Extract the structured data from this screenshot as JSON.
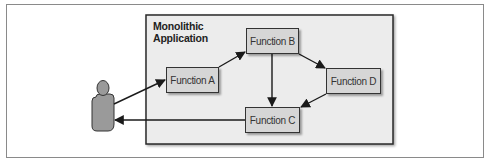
{
  "diagram": {
    "container": {
      "title_line1": "Monolithic",
      "title_line2": "Application"
    },
    "actor": {
      "type": "user",
      "icon": "person-icon"
    },
    "nodes": [
      {
        "id": "A",
        "label": "Function A"
      },
      {
        "id": "B",
        "label": "Function B"
      },
      {
        "id": "C",
        "label": "Function C"
      },
      {
        "id": "D",
        "label": "Function D"
      }
    ],
    "edges": [
      {
        "from": "user",
        "to": "Function A"
      },
      {
        "from": "Function A",
        "to": "Function B"
      },
      {
        "from": "Function B",
        "to": "Function D"
      },
      {
        "from": "Function B",
        "to": "Function C"
      },
      {
        "from": "Function D",
        "to": "Function C"
      },
      {
        "from": "Function C",
        "to": "user"
      }
    ],
    "colors": {
      "container_fill": "#ececec",
      "node_fill": "#d6d6d6",
      "actor_fill": "#9a9a9a",
      "line": "#1a1a1a"
    }
  }
}
